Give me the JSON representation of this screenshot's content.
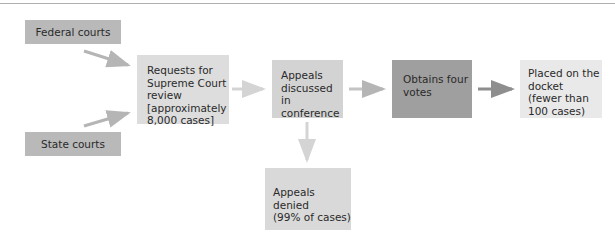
{
  "diagram": {
    "type": "flowchart",
    "nodes": [
      {
        "id": "federal",
        "label": "Federal courts",
        "color": "#b9b9b9"
      },
      {
        "id": "state",
        "label": "State courts",
        "color": "#b9b9b9"
      },
      {
        "id": "requests",
        "label": "Requests for\nSupreme Court\nreview\n[approximately\n8,000 cases]",
        "color": "#dddddd"
      },
      {
        "id": "discussed",
        "label": "Appeals\ndiscussed in\nconference",
        "color": "#d3d3d3"
      },
      {
        "id": "votes",
        "label": "Obtains four\nvotes",
        "color": "#9f9f9f"
      },
      {
        "id": "docket",
        "label": "Placed on the\ndocket\n(fewer than\n100 cases)",
        "color": "#e9e9e9"
      },
      {
        "id": "denied",
        "label": "Appeals denied\n(99% of cases)",
        "color": "#d9d9d9"
      }
    ],
    "edges": [
      {
        "from": "federal",
        "to": "requests"
      },
      {
        "from": "state",
        "to": "requests"
      },
      {
        "from": "requests",
        "to": "discussed"
      },
      {
        "from": "discussed",
        "to": "votes"
      },
      {
        "from": "votes",
        "to": "docket"
      },
      {
        "from": "discussed",
        "to": "denied"
      }
    ],
    "arrow_colors": {
      "light": "#d4d4d4",
      "medium": "#b5b5b5",
      "dark": "#8e8e8e"
    }
  }
}
